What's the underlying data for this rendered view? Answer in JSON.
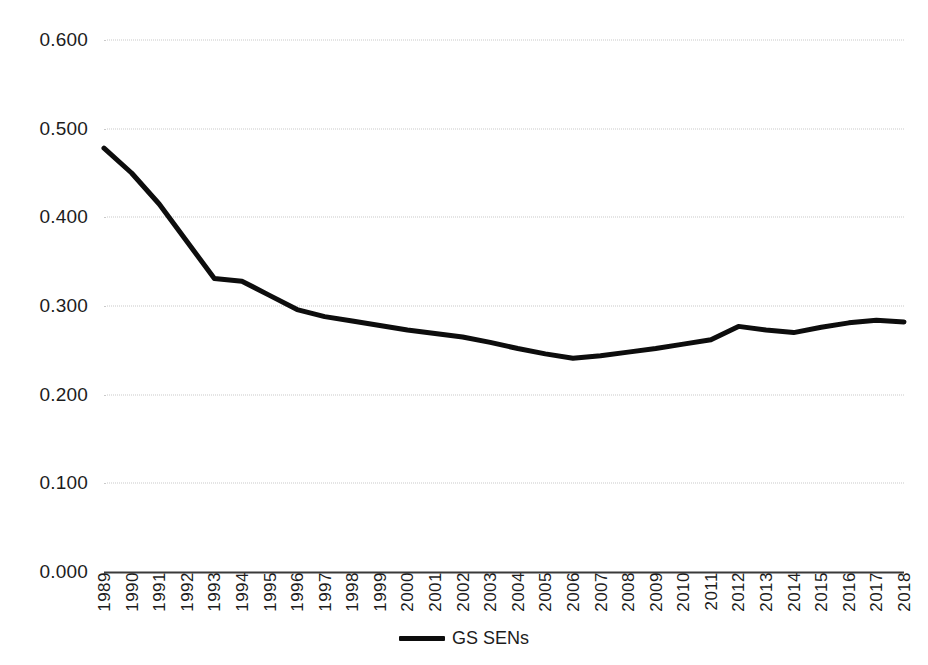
{
  "chart_data": {
    "type": "line",
    "title": "",
    "subtitle": "",
    "xlabel": "",
    "ylabel": "",
    "categories": [
      "1989",
      "1990",
      "1991",
      "1992",
      "1993",
      "1994",
      "1995",
      "1996",
      "1997",
      "1998",
      "1999",
      "2000",
      "2001",
      "2002",
      "2003",
      "2004",
      "2005",
      "2006",
      "2007",
      "2008",
      "2009",
      "2010",
      "2011",
      "2012",
      "2013",
      "2014",
      "2015",
      "2016",
      "2017",
      "2018"
    ],
    "series": [
      {
        "name": "GS SENs",
        "color": "#0d0d0d",
        "values": [
          0.478,
          0.45,
          0.415,
          0.373,
          0.331,
          0.328,
          0.312,
          0.296,
          0.288,
          0.283,
          0.278,
          0.273,
          0.269,
          0.265,
          0.259,
          0.252,
          0.246,
          0.241,
          0.244,
          0.248,
          0.252,
          0.257,
          0.262,
          0.277,
          0.273,
          0.27,
          0.276,
          0.281,
          0.284,
          0.282
        ]
      }
    ],
    "ylim": [
      0.0,
      0.6
    ],
    "ytick_values": [
      0.0,
      0.1,
      0.2,
      0.3,
      0.4,
      0.5,
      0.6
    ],
    "ytick_labels": [
      "0.000",
      "0.100",
      "0.200",
      "0.300",
      "0.400",
      "0.500",
      "0.600"
    ],
    "xlim": [
      "1989",
      "2018"
    ],
    "grid": "horizontal-dotted",
    "legend_position": "bottom-center",
    "legend_entries": [
      "GS SENs"
    ],
    "annotations": []
  },
  "legend": {
    "items": [
      {
        "label": "GS SENs",
        "swatch_color": "#0d0d0d"
      }
    ]
  },
  "colors": {
    "series_line": "#0d0d0d",
    "gridline": "#c9c9c9",
    "axis_line": "#3a3a3a",
    "text": "#1c1c1c",
    "background": "#ffffff"
  }
}
